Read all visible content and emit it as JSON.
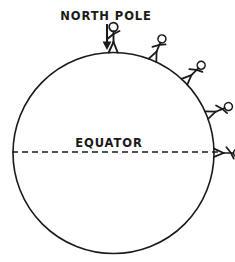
{
  "figure": {
    "background_color": "#ffffff",
    "ink_color": "#1a1a1a",
    "width": 235,
    "height": 262
  },
  "labels": {
    "north_pole": "NORTH POLE",
    "equator": "EQUATOR"
  },
  "annotations": {
    "pole_arrow": {
      "name": "downward-arrow",
      "points_to": "NORTH POLE",
      "x": 107,
      "y_start": 24,
      "y_end": 50
    },
    "equator_line": {
      "name": "equator-dashed-line",
      "style": "dashed",
      "dash": "6 4",
      "y": 152,
      "x_start": 12,
      "x_end": 222
    }
  },
  "chart_data": {
    "type": "scatter",
    "xlabel": "",
    "ylabel": "",
    "grid": false,
    "legend": null,
    "sphere": {
      "name": "earth-circle",
      "center_x": 113.5,
      "center_y": 153,
      "radius": 100.5,
      "stroke_width": 1.6
    },
    "categories": [
      "pole",
      "upper-mid",
      "mid",
      "lower-mid",
      "equator"
    ],
    "series": [
      {
        "name": "figure angle from north pole (degrees)",
        "values": [
          0,
          23,
          45,
          68,
          90
        ]
      },
      {
        "name": "figure tilt relative to page (degrees)",
        "values": [
          0,
          23,
          45,
          68,
          90
        ]
      }
    ],
    "figures": [
      {
        "id": 1,
        "name": "stick-figure-pole",
        "angle_deg": 0,
        "scale": 1.0
      },
      {
        "id": 2,
        "name": "stick-figure-upper-mid",
        "angle_deg": 23,
        "scale": 0.92
      },
      {
        "id": 3,
        "name": "stick-figure-mid",
        "angle_deg": 45,
        "scale": 0.92
      },
      {
        "id": 4,
        "name": "stick-figure-lower-mid",
        "angle_deg": 68,
        "scale": 0.92
      },
      {
        "id": 5,
        "name": "stick-figure-equator",
        "angle_deg": 90,
        "scale": 0.92
      }
    ],
    "text_positions": {
      "north_pole": {
        "x": 106,
        "y": 20,
        "anchor": "middle"
      },
      "equator": {
        "x": 109,
        "y": 147,
        "anchor": "middle"
      }
    }
  }
}
